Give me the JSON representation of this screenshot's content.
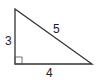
{
  "diagram": {
    "type": "right-triangle",
    "vertices": {
      "top": [
        15,
        9
      ],
      "right_angle": [
        15,
        64
      ],
      "right": [
        92,
        64
      ]
    },
    "sides": {
      "vertical": "3",
      "hypotenuse": "5",
      "horizontal": "4"
    },
    "right_angle_marker": true,
    "colors": {
      "stroke": "#333333",
      "text": "#222222"
    }
  }
}
